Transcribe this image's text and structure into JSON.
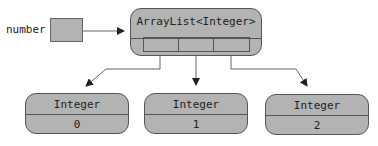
{
  "variable": {
    "name": "number"
  },
  "list_object": {
    "type": "ArrayList<Integer>",
    "cell_count": 3
  },
  "elements": [
    {
      "type": "Integer",
      "value": "0"
    },
    {
      "type": "Integer",
      "value": "1"
    },
    {
      "type": "Integer",
      "value": "2"
    }
  ],
  "colors": {
    "box_fill": "#b3b3b3",
    "stroke": "#555555",
    "arrow": "#666666"
  }
}
